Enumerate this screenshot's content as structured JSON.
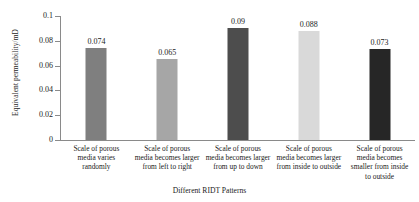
{
  "chart_data": {
    "type": "bar",
    "title": "",
    "xlabel": "Different RIDT Patterns",
    "ylabel": "Equivalent permeability/mD",
    "ylim": [
      0,
      0.1
    ],
    "yticks": [
      "0",
      "0.02",
      "0.04",
      "0.06",
      "0.08",
      "0.1"
    ],
    "ytick_values": [
      0,
      0.02,
      0.04,
      0.06,
      0.08,
      0.1
    ],
    "grid": false,
    "legend": "none",
    "categories": [
      "Scale of porous media varies randomly",
      "Scale of porous media becomes larger from left to right",
      "Scale of porous media becomes larger from up to down",
      "Scale of porous media becomes larger from inside to outside",
      "Scale of porous media becomes smaller from inside to outside"
    ],
    "values": [
      0.074,
      0.065,
      0.09,
      0.088,
      0.073
    ],
    "value_labels": [
      "0.074",
      "0.065",
      "0.09",
      "0.088",
      "0.073"
    ],
    "bar_colors": [
      "#7f7f7f",
      "#a6a6a6",
      "#4d4d4d",
      "#d9d9d9",
      "#262626"
    ]
  }
}
